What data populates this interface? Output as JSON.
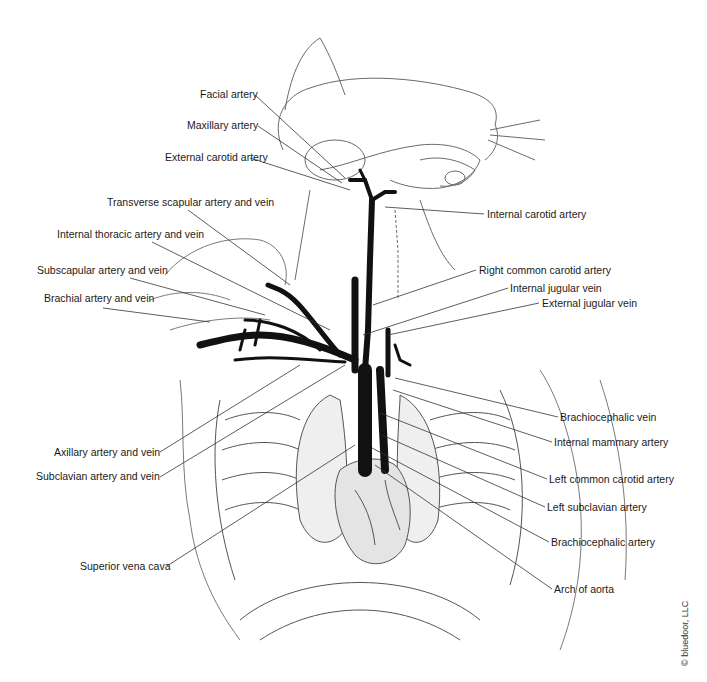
{
  "figure": {
    "copyright": "© bluedoor, LLC",
    "labels_left": [
      {
        "id": "facial-artery",
        "text": "Facial artery",
        "x": 200,
        "y": 88,
        "lx": 255,
        "ly": 95,
        "tx": 345,
        "ty": 178
      },
      {
        "id": "maxillary-artery",
        "text": "Maxillary artery",
        "x": 187,
        "y": 119,
        "lx": 258,
        "ly": 126,
        "tx": 342,
        "ty": 183
      },
      {
        "id": "external-carotid-artery",
        "text": "External carotid artery",
        "x": 165,
        "y": 151,
        "lx": 250,
        "ly": 158,
        "tx": 350,
        "ty": 190
      },
      {
        "id": "transverse-scapular-artery-vein",
        "text": "Transverse scapular artery and vein",
        "x": 107,
        "y": 196,
        "lx": 188,
        "ly": 210,
        "tx": 290,
        "ty": 285
      },
      {
        "id": "internal-thoracic-artery-vein",
        "text": "Internal thoracic artery and vein",
        "x": 57,
        "y": 228,
        "lx": 152,
        "ly": 242,
        "tx": 330,
        "ty": 330
      },
      {
        "id": "subscapular-artery-vein",
        "text": "Subscapular artery and vein",
        "x": 37,
        "y": 264,
        "lx": 130,
        "ly": 278,
        "tx": 265,
        "ty": 315
      },
      {
        "id": "brachial-artery-vein",
        "text": "Brachial artery and vein",
        "x": 44,
        "y": 292,
        "lx": 103,
        "ly": 308,
        "tx": 210,
        "ty": 322
      },
      {
        "id": "axillary-artery-vein",
        "text": "Axillary artery and vein",
        "x": 54,
        "y": 446,
        "lx": 160,
        "ly": 452,
        "tx": 300,
        "ty": 365
      },
      {
        "id": "subclavian-artery-vein",
        "text": "Subclavian artery and vein",
        "x": 36,
        "y": 470,
        "lx": 160,
        "ly": 477,
        "tx": 345,
        "ty": 365
      },
      {
        "id": "superior-vena-cava",
        "text": "Superior vena cava",
        "x": 80,
        "y": 560,
        "lx": 167,
        "ly": 566,
        "tx": 355,
        "ty": 445
      }
    ],
    "labels_right": [
      {
        "id": "internal-carotid-artery",
        "text": "Internal carotid artery",
        "x": 487,
        "y": 208,
        "lx": 484,
        "ly": 214,
        "tx": 385,
        "ty": 207
      },
      {
        "id": "right-common-carotid-artery",
        "text": "Right common carotid artery",
        "x": 479,
        "y": 264,
        "lx": 476,
        "ly": 270,
        "tx": 373,
        "ty": 305
      },
      {
        "id": "internal-jugular-vein",
        "text": "Internal jugular vein",
        "x": 510,
        "y": 282,
        "lx": 508,
        "ly": 288,
        "tx": 363,
        "ty": 335
      },
      {
        "id": "external-jugular-vein",
        "text": "External jugular vein",
        "x": 542,
        "y": 297,
        "lx": 539,
        "ly": 303,
        "tx": 388,
        "ty": 335
      },
      {
        "id": "brachiocephalic-vein",
        "text": "Brachiocephalic vein",
        "x": 560,
        "y": 411,
        "lx": 558,
        "ly": 417,
        "tx": 395,
        "ty": 378
      },
      {
        "id": "internal-mammary-artery",
        "text": "Internal mammary artery",
        "x": 554,
        "y": 436,
        "lx": 552,
        "ly": 442,
        "tx": 393,
        "ty": 390
      },
      {
        "id": "left-common-carotid-artery",
        "text": "Left common carotid artery",
        "x": 549,
        "y": 473,
        "lx": 547,
        "ly": 479,
        "tx": 380,
        "ty": 413
      },
      {
        "id": "left-subclavian-artery",
        "text": "Left subclavian artery",
        "x": 547,
        "y": 501,
        "lx": 545,
        "ly": 507,
        "tx": 382,
        "ty": 435
      },
      {
        "id": "brachiocephalic-artery",
        "text": "Brachiocephalic artery",
        "x": 551,
        "y": 536,
        "lx": 549,
        "ly": 542,
        "tx": 372,
        "ty": 448
      },
      {
        "id": "arch-of-aorta",
        "text": "Arch of aorta",
        "x": 554,
        "y": 583,
        "lx": 552,
        "ly": 589,
        "tx": 375,
        "ty": 465
      }
    ]
  },
  "colors": {
    "background": "#ffffff",
    "ink": "#1a1a1a",
    "vessel": "#111111",
    "sketch": "#6a6a6a",
    "leader": "#333333"
  }
}
